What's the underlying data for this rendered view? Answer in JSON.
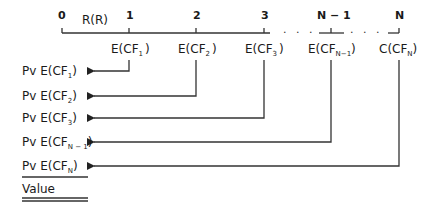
{
  "timeline": {
    "start_label": "0",
    "rate_label": "R(R)",
    "ticks": [
      "1",
      "2",
      "3",
      "N − 1",
      "N"
    ],
    "ellipsis": ". . ."
  },
  "cash_flows": [
    {
      "prefix": "E(CF",
      "sub": "1",
      "suffix": ")"
    },
    {
      "prefix": "E(CF",
      "sub": "2",
      "suffix": ")"
    },
    {
      "prefix": "E(CF",
      "sub": "3",
      "suffix": ")"
    },
    {
      "prefix": "E(CF",
      "sub": "N−1",
      "suffix": ")"
    },
    {
      "prefix": "C(CF",
      "sub": "N",
      "suffix": ")"
    }
  ],
  "present_values": [
    {
      "prefix": "Pv E(CF",
      "sub": "1",
      "suffix": ")"
    },
    {
      "prefix": "Pv E(CF",
      "sub": "2",
      "suffix": ")"
    },
    {
      "prefix": "Pv E(CF",
      "sub": "3",
      "suffix": ")"
    },
    {
      "prefix": "Pv E(CF",
      "sub": "N − 1",
      "suffix": ")"
    },
    {
      "prefix": "Pv E(CF",
      "sub": "N",
      "suffix": ")"
    }
  ],
  "total_label": "Value"
}
